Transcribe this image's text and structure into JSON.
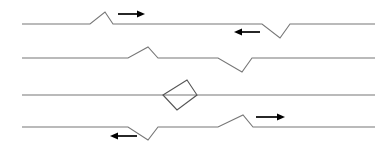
{
  "figure": {
    "background_color": "#ffffff",
    "line_color": "#777777",
    "loop_color": "#555555",
    "arrow_color": "#000000",
    "canvas": {
      "width": 388,
      "height": 152
    }
  },
  "chart_data": {
    "type": "line",
    "xlabel": "",
    "ylabel": "",
    "grid": false,
    "legend": "none",
    "xlim": [
      22,
      375
    ],
    "ylim": [
      0,
      152
    ],
    "baseline_x_start": 22,
    "baseline_x_end": 375,
    "series": [
      {
        "name": "frame-1",
        "baseline_y": 24,
        "points": [
          [
            22,
            24
          ],
          [
            90,
            24
          ],
          [
            105,
            12
          ],
          [
            113,
            24
          ],
          [
            262,
            24
          ],
          [
            280,
            38
          ],
          [
            290,
            24
          ],
          [
            375,
            24
          ]
        ],
        "features": [
          {
            "kind": "crest",
            "apex_x": 105,
            "apex_y": 12,
            "direction": "right"
          },
          {
            "kind": "trough",
            "apex_x": 280,
            "apex_y": 38,
            "direction": "left"
          }
        ]
      },
      {
        "name": "frame-2",
        "baseline_y": 58,
        "points": [
          [
            22,
            58
          ],
          [
            128,
            58
          ],
          [
            148,
            47
          ],
          [
            158,
            58
          ],
          [
            218,
            58
          ],
          [
            242,
            72
          ],
          [
            252,
            58
          ],
          [
            375,
            58
          ]
        ],
        "features": [
          {
            "kind": "crest",
            "apex_x": 148,
            "apex_y": 47,
            "direction": "right"
          },
          {
            "kind": "trough",
            "apex_x": 242,
            "apex_y": 72,
            "direction": "left"
          }
        ]
      },
      {
        "name": "frame-3",
        "baseline_y": 95,
        "points": [
          [
            22,
            95
          ],
          [
            375,
            95
          ]
        ],
        "features": [
          {
            "kind": "closed-loop",
            "vertices": [
              [
                163,
                95
              ],
              [
                187,
                80
              ],
              [
                197,
                95
              ],
              [
                177,
                110
              ]
            ]
          }
        ]
      },
      {
        "name": "frame-4",
        "baseline_y": 127,
        "points": [
          [
            22,
            127
          ],
          [
            128,
            127
          ],
          [
            148,
            140
          ],
          [
            158,
            127
          ],
          [
            218,
            127
          ],
          [
            243,
            115
          ],
          [
            253,
            127
          ],
          [
            375,
            127
          ]
        ],
        "features": [
          {
            "kind": "trough",
            "apex_x": 148,
            "apex_y": 140,
            "direction": "left"
          },
          {
            "kind": "crest",
            "apex_x": 243,
            "apex_y": 115,
            "direction": "right"
          }
        ]
      }
    ],
    "annotations": [
      {
        "name": "arrow-right-frame-1",
        "frame": "frame-1",
        "direction": "right",
        "x1": 118,
        "x2": 145,
        "y": 14
      },
      {
        "name": "arrow-left-frame-1",
        "frame": "frame-1",
        "direction": "left",
        "x1": 260,
        "x2": 234,
        "y": 32
      },
      {
        "name": "arrow-left-frame-4",
        "frame": "frame-4",
        "direction": "left",
        "x1": 137,
        "x2": 110,
        "y": 136
      },
      {
        "name": "arrow-right-frame-4",
        "frame": "frame-4",
        "direction": "right",
        "x1": 256,
        "x2": 285,
        "y": 117
      }
    ]
  }
}
